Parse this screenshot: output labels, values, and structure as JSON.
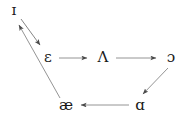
{
  "diagram": {
    "type": "directed-cycle-graph",
    "background_color": "#ffffff",
    "stroke_color": "#555555",
    "text_color": "#1a1a1a",
    "nodes": [
      {
        "id": "i",
        "label": "ɪ",
        "name": "near-close-front-unrounded",
        "x": 14,
        "y": 10
      },
      {
        "id": "epsilon",
        "label": "ɛ",
        "name": "open-mid-front-unrounded",
        "x": 48,
        "y": 57
      },
      {
        "id": "lambda",
        "label": "Λ",
        "name": "open-mid-back-unrounded",
        "x": 103,
        "y": 57
      },
      {
        "id": "openo",
        "label": "ɔ",
        "name": "open-mid-back-rounded",
        "x": 171,
        "y": 57
      },
      {
        "id": "ash",
        "label": "æ",
        "name": "near-open-front-unrounded",
        "x": 66,
        "y": 105
      },
      {
        "id": "scripta",
        "label": "ɑ",
        "name": "open-back-unrounded",
        "x": 140,
        "y": 105
      }
    ],
    "edges": [
      {
        "id": "e1",
        "from": "i",
        "to": "epsilon",
        "label": "",
        "direction": "down-right"
      },
      {
        "id": "e2",
        "from": "epsilon",
        "to": "lambda",
        "label": "",
        "direction": "right"
      },
      {
        "id": "e3",
        "from": "lambda",
        "to": "openo",
        "label": "",
        "direction": "right"
      },
      {
        "id": "e4",
        "from": "openo",
        "to": "scripta",
        "label": "",
        "direction": "down-left"
      },
      {
        "id": "e5",
        "from": "scripta",
        "to": "ash",
        "label": "",
        "direction": "left"
      },
      {
        "id": "e6",
        "from": "ash",
        "to": "i",
        "label": "",
        "direction": "up-left"
      }
    ]
  }
}
